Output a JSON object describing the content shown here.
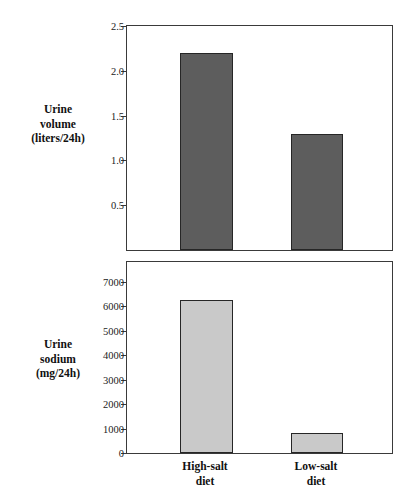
{
  "chart_data": [
    {
      "type": "bar",
      "id": "urine-volume",
      "title": "",
      "ylabel": "Urine\nvolume\n(liters/24h)",
      "ylabel_lines": [
        "Urine",
        "volume",
        "(liters/24h)"
      ],
      "xlabel": "",
      "categories": [
        "High-salt diet",
        "Low-salt diet"
      ],
      "values": [
        2.2,
        1.3
      ],
      "ylim": [
        0,
        2.5
      ],
      "yticks": [
        0.5,
        1.0,
        1.5,
        2.0,
        2.5
      ],
      "ytick_labels": [
        "0.5",
        "1.0",
        "1.5",
        "2.0",
        "2.5"
      ],
      "bar_color": "#5d5d5d",
      "bar_edge_color": "#262626",
      "grid": false,
      "legend": null
    },
    {
      "type": "bar",
      "id": "urine-sodium",
      "title": "",
      "ylabel": "Urine\nsodium\n(mg/24h)",
      "ylabel_lines": [
        "Urine",
        "sodium",
        "(mg/24h)"
      ],
      "xlabel": "",
      "categories": [
        "High-salt diet",
        "Low-salt diet"
      ],
      "values": [
        6250,
        800
      ],
      "ylim": [
        0,
        7800
      ],
      "yticks": [
        0,
        1000,
        2000,
        3000,
        4000,
        5000,
        6000,
        7000
      ],
      "ytick_labels": [
        "0",
        "1000",
        "2000",
        "3000",
        "4000",
        "5000",
        "6000",
        "7000"
      ],
      "bar_color": "#c9c9c9",
      "bar_edge_color": "#262626",
      "grid": false,
      "legend": null
    }
  ],
  "figure": {
    "background": "#ffffff",
    "axis_color": "#3a3a3a",
    "text_color": "#111111",
    "category_labels": [
      {
        "line1": "High-salt",
        "line2": "diet"
      },
      {
        "line1": "Low-salt",
        "line2": "diet"
      }
    ]
  }
}
